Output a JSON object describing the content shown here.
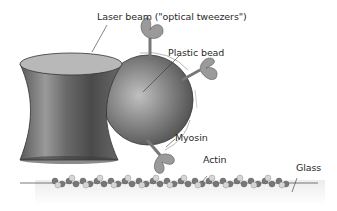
{
  "diagram": {
    "labels": {
      "laser_beam": "Laser beam (\"optical tweezers\")",
      "plastic_bead": "Plastic bead",
      "myosin": "Myosin",
      "actin": "Actin",
      "glass": "Glass"
    },
    "colors": {
      "beam_dark": "#4a4a4a",
      "beam_light": "#b8b8b8",
      "bead": "#8a8a8a",
      "myosin": "#9a9a9a",
      "actin_dark": "#6e6e6e",
      "actin_light": "#d6d6d6",
      "glass_line": "#555555",
      "text": "#2a2a2a"
    }
  }
}
